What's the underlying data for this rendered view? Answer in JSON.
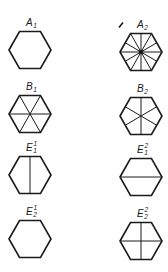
{
  "diagram": {
    "stroke_color": "#1a1a1a",
    "background": "#ffffff",
    "panels": [
      {
        "id": "A1",
        "base": "A",
        "sub": "1",
        "sup": "",
        "cx": 30,
        "cy": 50,
        "pattern": "empty"
      },
      {
        "id": "A2",
        "base": "A",
        "sub": "2",
        "sup": "",
        "cx": 141,
        "cy": 52,
        "pattern": "twelve-rays",
        "mark": "arrow"
      },
      {
        "id": "B1",
        "base": "B",
        "sub": "1",
        "sup": "",
        "cx": 30,
        "cy": 114,
        "pattern": "vertex-diagonals"
      },
      {
        "id": "B2",
        "base": "B",
        "sub": "2",
        "sup": "",
        "cx": 141,
        "cy": 116,
        "pattern": "edge-midpoint-rays"
      },
      {
        "id": "E1_1",
        "base": "E",
        "sub": "1",
        "sup": "1",
        "cx": 30,
        "cy": 175,
        "pattern": "vertical-line"
      },
      {
        "id": "E1_2",
        "base": "E",
        "sub": "1",
        "sup": "2",
        "cx": 141,
        "cy": 177,
        "pattern": "horizontal-line"
      },
      {
        "id": "E2_1",
        "base": "E",
        "sub": "2",
        "sup": "1",
        "cx": 30,
        "cy": 239,
        "pattern": "empty"
      },
      {
        "id": "E2_2",
        "base": "E",
        "sub": "2",
        "sup": "2",
        "cx": 141,
        "cy": 241,
        "pattern": "cross"
      }
    ]
  }
}
